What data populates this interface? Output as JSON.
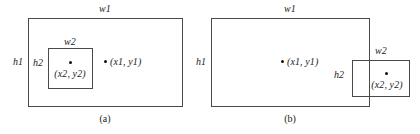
{
  "figure": {
    "title": "",
    "panels": [
      {
        "id": "a",
        "caption": "(a)",
        "outer_rect": {
          "width_label": "w1",
          "height_label": "h1"
        },
        "inner_rect": {
          "width_label": "w2",
          "height_label": "h2"
        },
        "points": [
          {
            "label": "(x1, y1)",
            "name": "point-x1-y1"
          },
          {
            "label": "(x2, y2)",
            "name": "point-x2-y2"
          }
        ]
      },
      {
        "id": "b",
        "caption": "(b)",
        "outer_rect": {
          "width_label": "w1",
          "height_label": "h1"
        },
        "inner_rect": {
          "width_label": "w2",
          "height_label": "h2"
        },
        "points": [
          {
            "label": "(x1, y1)",
            "name": "point-x1-y1"
          },
          {
            "label": "(x2, y2)",
            "name": "point-x2-y2"
          }
        ]
      }
    ]
  },
  "colors": {
    "stroke": "#4a4a4a",
    "dot": "#111111",
    "text": "#1a1a1a",
    "background": "#ffffff"
  }
}
